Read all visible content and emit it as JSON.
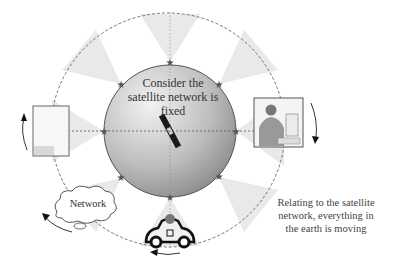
{
  "diagram": {
    "center_text": "Consider the satellite network is fixed",
    "center_lines": [
      "Consider the",
      "satellite network is",
      "fixed"
    ],
    "side_text": "Relating to the satellite network, everything in the earth is moving",
    "side_lines": [
      "Relating to the satellite",
      "network, everything in",
      "the earth is moving"
    ],
    "network_label": "Network",
    "colors": {
      "earth_light": "#e8e8e8",
      "earth_dark": "#8c8c8c",
      "beam": "#e6e6e6",
      "line": "#555555",
      "star": "#555555"
    },
    "elements": {
      "satellites": 8,
      "ground_objects": [
        "building-box",
        "person-at-computer",
        "network-cloud",
        "car"
      ]
    }
  }
}
